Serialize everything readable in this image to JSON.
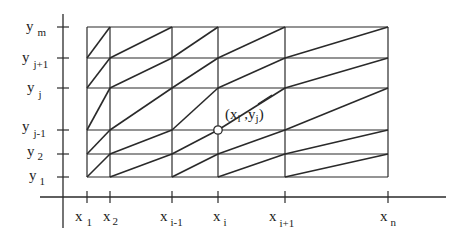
{
  "diagram": {
    "type": "triangulated-grid",
    "colors": {
      "line": "#2a2a2a",
      "background": "#ffffff",
      "point_fill": "#ffffff"
    },
    "x_labels": [
      {
        "base": "x",
        "sub": "1"
      },
      {
        "base": "x",
        "sub": "2"
      },
      {
        "base": "x",
        "sub": "i-1"
      },
      {
        "base": "x",
        "sub": "i"
      },
      {
        "base": "x",
        "sub": "i+1"
      },
      {
        "base": "x",
        "sub": "n"
      }
    ],
    "y_labels": [
      {
        "base": "y",
        "sub": "m"
      },
      {
        "base": "y",
        "sub": "j+1"
      },
      {
        "base": "y",
        "sub": "j"
      },
      {
        "base": "y",
        "sub": "j-1"
      },
      {
        "base": "y",
        "sub": "2"
      },
      {
        "base": "y",
        "sub": "1"
      }
    ],
    "highlight_point": {
      "label": "(x_i ,y_j)",
      "open": "(x",
      "sub_i": "i",
      "mid": " ,y",
      "sub_j": "j",
      "close": ")"
    }
  }
}
